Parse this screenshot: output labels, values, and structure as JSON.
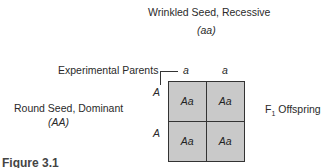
{
  "diagram": {
    "top_parent": {
      "label": "Wrinkled Seed, Recessive",
      "genotype": "(aa)"
    },
    "left_parent": {
      "label": "Round Seed, Dominant",
      "genotype": "(AA)"
    },
    "experimental_parents_label": "Experimental Parents",
    "column_alleles": [
      "a",
      "a"
    ],
    "row_alleles": [
      "A",
      "A"
    ],
    "cells": [
      "Aa",
      "Aa",
      "Aa",
      "Aa"
    ],
    "offspring_label": {
      "prefix": "F",
      "subscript": "1",
      "suffix": " Offspring"
    },
    "caption": "Figure 3.1"
  }
}
